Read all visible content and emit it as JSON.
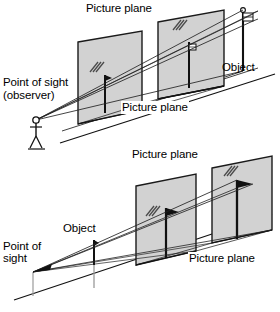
{
  "figure": {
    "background_color": "#ffffff",
    "line_color": "#000000",
    "plane_fill": "#d2d2d2",
    "plane_stroke": "#1a1a1a",
    "ray_color": "#222222",
    "ghost_color": "#9a9a9a"
  },
  "diagrams": [
    {
      "id": "upper",
      "description": "Converging projection: object is behind both picture planes; projected image is smaller on the nearer plane.",
      "labels": {
        "picture_plane_far": "Picture plane",
        "picture_plane_near": "Picture plane",
        "object": "Object",
        "point_of_sight_line1": "Point of sight",
        "point_of_sight_line2": "(observer)"
      },
      "elements": {
        "observer": "stick-figure",
        "object_marker": "vertical-pole-with-flag",
        "planes": 2
      }
    },
    {
      "id": "lower",
      "description": "Diverging projection: object is in front of both picture planes; projected image is larger on the farther plane.",
      "labels": {
        "picture_plane_far": "Picture plane",
        "picture_plane_near": "Picture plane",
        "object": "Object",
        "point_of_sight_line1": "Point of",
        "point_of_sight_line2": "sight"
      },
      "elements": {
        "observer": "apex-point",
        "object_marker": "vertical-pole-with-flag",
        "planes": 2
      }
    }
  ]
}
